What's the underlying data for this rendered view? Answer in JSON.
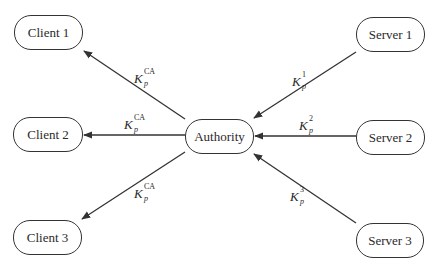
{
  "diagram": {
    "nodes": {
      "client1": "Client 1",
      "client2": "Client 2",
      "client3": "Client 3",
      "authority": "Authority",
      "server1": "Server 1",
      "server2": "Server 2",
      "server3": "Server 3"
    },
    "edges": [
      {
        "from": "Authority",
        "to": "Client 1",
        "label_base": "K",
        "label_sub": "p",
        "label_sup": "CA"
      },
      {
        "from": "Authority",
        "to": "Client 2",
        "label_base": "K",
        "label_sub": "p",
        "label_sup": "CA"
      },
      {
        "from": "Authority",
        "to": "Client 3",
        "label_base": "K",
        "label_sub": "p",
        "label_sup": "CA"
      },
      {
        "from": "Server 1",
        "to": "Authority",
        "label_base": "K",
        "label_sub": "p",
        "label_sup": "1"
      },
      {
        "from": "Server 2",
        "to": "Authority",
        "label_base": "K",
        "label_sub": "p",
        "label_sup": "2"
      },
      {
        "from": "Server 3",
        "to": "Authority",
        "label_base": "K",
        "label_sub": "p",
        "label_sup": "3"
      }
    ],
    "colors": {
      "stroke": "#333333",
      "background": "#ffffff"
    }
  }
}
